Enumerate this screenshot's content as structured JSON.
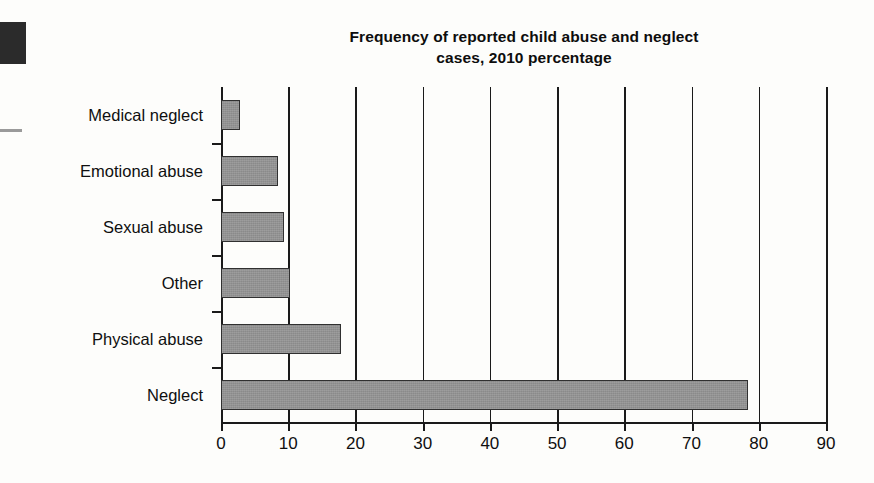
{
  "chart_data": {
    "type": "bar",
    "orientation": "horizontal",
    "title": "Frequency of reported child abuse and neglect cases, 2010 percentage",
    "title_lines": [
      "Frequency of reported child abuse and neglect",
      "cases, 2010 percentage"
    ],
    "categories": [
      "Medical neglect",
      "Emotional abuse",
      "Sexual abuse",
      "Other",
      "Physical abuse",
      "Neglect"
    ],
    "values": [
      2.9,
      8.5,
      9.4,
      10.2,
      17.9,
      78.4
    ],
    "xlabel": "",
    "ylabel": "",
    "xlim": [
      0,
      90
    ],
    "xticks": [
      0,
      10,
      20,
      30,
      40,
      50,
      60,
      70,
      80,
      90
    ],
    "xtick_labels": [
      "0",
      "10",
      "20",
      "30",
      "40",
      "50",
      "60",
      "70",
      "80",
      "90"
    ],
    "grid": "vertical",
    "legend": null,
    "bar_color": "#8a8a8a",
    "bar_border_color": "#303030",
    "axis_color": "#1a1a1a",
    "background": "#fdfdfb"
  }
}
